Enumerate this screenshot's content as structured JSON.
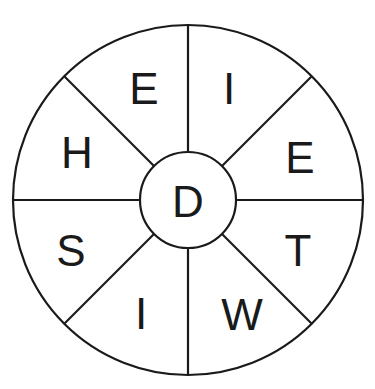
{
  "puzzle": {
    "type": "word-wheel",
    "center_letter": "D",
    "sectors": [
      {
        "position": "top-right",
        "letter": "I"
      },
      {
        "position": "right-upper",
        "letter": "E"
      },
      {
        "position": "right-lower",
        "letter": "T"
      },
      {
        "position": "bottom-right",
        "letter": "W"
      },
      {
        "position": "bottom-left",
        "letter": "I"
      },
      {
        "position": "left-lower",
        "letter": "S"
      },
      {
        "position": "left-upper",
        "letter": "H"
      },
      {
        "position": "top-left",
        "letter": "E"
      }
    ]
  },
  "colors": {
    "line": "#1a1a1a",
    "background": "#ffffff"
  }
}
